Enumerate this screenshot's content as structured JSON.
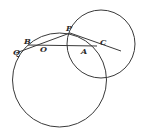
{
  "diagram": {
    "type": "geometry",
    "labels": {
      "P": "P",
      "B": "B",
      "Q": "Q",
      "O": "O",
      "A": "A",
      "C": "C"
    },
    "circles": [
      {
        "name": "large-circle",
        "cx": 59.5,
        "cy": 80,
        "r": 47
      },
      {
        "name": "small-circle",
        "cx": 101,
        "cy": 44,
        "r": 34
      }
    ],
    "colors": {
      "stroke": "#3a3a3a",
      "background": "#ffffff"
    }
  }
}
